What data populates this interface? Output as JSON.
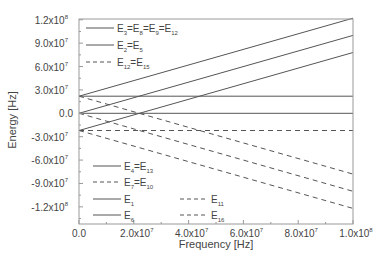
{
  "chart_data": {
    "type": "line",
    "title": "",
    "xlabel": "Frequency [Hz]",
    "ylabel": "Energy [Hz]",
    "xlim": [
      0,
      100000000
    ],
    "ylim": [
      -142000000,
      121000000
    ],
    "grid": false,
    "legend_position": "inside, upper-left and lower-left",
    "x_ticks": [
      {
        "value": 0,
        "mant": "0.0",
        "exp": ""
      },
      {
        "value": 20000000,
        "mant": "2.0x10",
        "exp": "7"
      },
      {
        "value": 40000000,
        "mant": "4.0x10",
        "exp": "7"
      },
      {
        "value": 60000000,
        "mant": "6.0x10",
        "exp": "7"
      },
      {
        "value": 80000000,
        "mant": "8.0x10",
        "exp": "7"
      },
      {
        "value": 100000000,
        "mant": "1.0x10",
        "exp": "8"
      }
    ],
    "y_ticks": [
      {
        "value": 120000000,
        "mant": "1.2x10",
        "exp": "8"
      },
      {
        "value": 90000000,
        "mant": "9.0x10",
        "exp": "7"
      },
      {
        "value": 60000000,
        "mant": "6.0x10",
        "exp": "7"
      },
      {
        "value": 30000000,
        "mant": "3.0x10",
        "exp": "7"
      },
      {
        "value": 0,
        "mant": "0.0",
        "exp": ""
      },
      {
        "value": -30000000,
        "mant": "-3.0x10",
        "exp": "7"
      },
      {
        "value": -60000000,
        "mant": "-6.0x10",
        "exp": "7"
      },
      {
        "value": -90000000,
        "mant": "-9.0x10",
        "exp": "7"
      },
      {
        "value": -120000000,
        "mant": "-1.2x10",
        "exp": "8"
      }
    ],
    "x": [
      0,
      100000000
    ],
    "series": [
      {
        "name": "E3=E8=E9=E12",
        "style": "solid",
        "values": [
          0,
          0
        ]
      },
      {
        "name": "E2=E5",
        "style": "solid",
        "values": [
          22000000,
          22000000
        ]
      },
      {
        "name": "E12=E15",
        "style": "dashed",
        "values": [
          -22000000,
          -22000000
        ]
      },
      {
        "name": "E4=E13",
        "style": "solid",
        "values": [
          0,
          100000000
        ]
      },
      {
        "name": "E7=E10",
        "style": "dashed",
        "values": [
          0,
          -100000000
        ]
      },
      {
        "name": "E1",
        "style": "solid",
        "values": [
          22000000,
          122000000
        ]
      },
      {
        "name": "E6",
        "style": "solid",
        "values": [
          -22000000,
          78000000
        ]
      },
      {
        "name": "E11",
        "style": "dashed",
        "values": [
          22000000,
          -78000000
        ]
      },
      {
        "name": "E16",
        "style": "dashed",
        "values": [
          -22000000,
          -122000000
        ]
      }
    ],
    "legend_entries": [
      {
        "base": "E",
        "subs": [
          "3",
          "8",
          "9",
          "12"
        ],
        "style": "solid"
      },
      {
        "base": "E",
        "subs": [
          "2",
          "5"
        ],
        "style": "solid"
      },
      {
        "base": "E",
        "subs": [
          "12",
          "15"
        ],
        "style": "dashed"
      },
      {
        "base": "E",
        "subs": [
          "4",
          "13"
        ],
        "style": "solid"
      },
      {
        "base": "E",
        "subs": [
          "7",
          "10"
        ],
        "style": "dashed"
      },
      {
        "base": "E",
        "subs": [
          "1"
        ],
        "style": "solid"
      },
      {
        "base": "E",
        "subs": [
          "6"
        ],
        "style": "solid"
      },
      {
        "base": "E",
        "subs": [
          "11"
        ],
        "style": "dashed"
      },
      {
        "base": "E",
        "subs": [
          "16"
        ],
        "style": "dashed"
      }
    ],
    "colors": {
      "line": "#555555",
      "axis": "#888888",
      "text": "#444444"
    }
  }
}
